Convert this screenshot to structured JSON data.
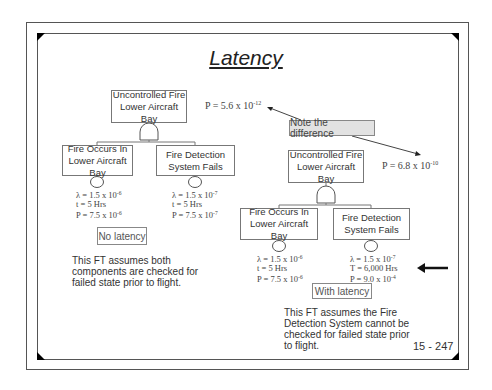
{
  "slide": {
    "title": "Latency",
    "page_number": "15 - 247",
    "note": "Note the difference",
    "colors": {
      "frame": "#555555",
      "note_fill": "#e2e2e2",
      "box_border": "#777777"
    }
  },
  "left_tree": {
    "top_event": {
      "line1": "Uncontrolled Fire",
      "line2": "Lower Aircraft Bay"
    },
    "probability": {
      "base": "P = 5.6 x 10",
      "exp": "-12"
    },
    "gate": "and-gate",
    "children": [
      {
        "line1": "Fire Occurs In",
        "line2": "Lower Aircraft Bay",
        "lambda": {
          "base": "λ = 1.5 x 10",
          "exp": "-6"
        },
        "time": "t = 5 Hrs",
        "prob": {
          "base": "P = 7.5 x 10",
          "exp": "-6"
        }
      },
      {
        "line1": "Fire Detection",
        "line2": "System Fails",
        "lambda": {
          "base": "λ = 1.5 x 10",
          "exp": "-7"
        },
        "time": "t = 5 Hrs",
        "prob": {
          "base": "P = 7.5 x 10",
          "exp": "-7"
        }
      }
    ],
    "label": "No latency",
    "description": [
      "This FT assumes both",
      "components are checked for",
      "failed state prior to flight."
    ]
  },
  "right_tree": {
    "top_event": {
      "line1": "Uncontrolled Fire",
      "line2": "Lower Aircraft Bay"
    },
    "probability": {
      "base": "P = 6.8 x 10",
      "exp": "-10"
    },
    "gate": "and-gate",
    "children": [
      {
        "line1": "Fire Occurs In",
        "line2": "Lower Aircraft Bay",
        "lambda": {
          "base": "λ = 1.5 x 10",
          "exp": "-6"
        },
        "time": "t = 5 Hrs",
        "prob": {
          "base": "P = 7.5 x 10",
          "exp": "-6"
        }
      },
      {
        "line1": "Fire Detection",
        "line2": "System Fails",
        "lambda": {
          "base": "λ = 1.5 x 10",
          "exp": "-7"
        },
        "time": "T = 6,000 Hrs",
        "prob": {
          "base": "P = 9.0 x 10",
          "exp": "-4"
        }
      }
    ],
    "label": "With latency",
    "description": [
      "This FT assumes the Fire",
      "Detection System cannot be",
      "checked for failed state prior",
      "to flight."
    ]
  }
}
